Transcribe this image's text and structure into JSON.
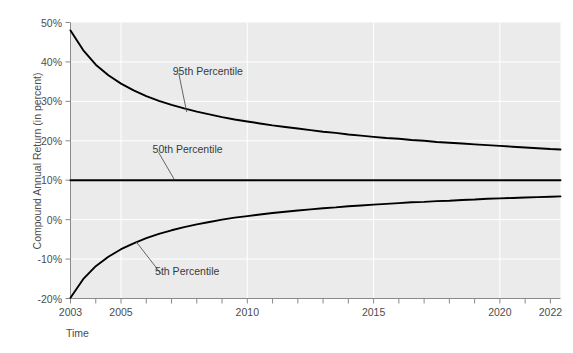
{
  "header_fragment": "",
  "chart_data": {
    "type": "line",
    "title": "",
    "xlabel": "Time",
    "ylabel": "Compound Annual Return (in percent)",
    "xlim": [
      2003,
      2022.4
    ],
    "ylim": [
      -20,
      50
    ],
    "grid": true,
    "legend_position": "inline-annotations",
    "x_ticks": [
      {
        "value": 2003,
        "label": "2003"
      },
      {
        "value": 2004,
        "label": ""
      },
      {
        "value": 2005,
        "label": "2005"
      },
      {
        "value": 2006,
        "label": ""
      },
      {
        "value": 2007,
        "label": ""
      },
      {
        "value": 2008,
        "label": ""
      },
      {
        "value": 2009,
        "label": ""
      },
      {
        "value": 2010,
        "label": "2010"
      },
      {
        "value": 2011,
        "label": ""
      },
      {
        "value": 2012,
        "label": ""
      },
      {
        "value": 2013,
        "label": ""
      },
      {
        "value": 2014,
        "label": ""
      },
      {
        "value": 2015,
        "label": "2015"
      },
      {
        "value": 2016,
        "label": ""
      },
      {
        "value": 2017,
        "label": ""
      },
      {
        "value": 2018,
        "label": ""
      },
      {
        "value": 2019,
        "label": ""
      },
      {
        "value": 2020,
        "label": "2020"
      },
      {
        "value": 2021,
        "label": ""
      },
      {
        "value": 2022,
        "label": "2022"
      }
    ],
    "y_ticks": [
      {
        "value": 50,
        "label": "50%"
      },
      {
        "value": 40,
        "label": "40%"
      },
      {
        "value": 30,
        "label": "30%"
      },
      {
        "value": 20,
        "label": "20%"
      },
      {
        "value": 10,
        "label": "10%"
      },
      {
        "value": 0,
        "label": "0%"
      },
      {
        "value": -10,
        "label": "-10%"
      },
      {
        "value": -20,
        "label": "-20%"
      }
    ],
    "gridlines_x": [
      2005,
      2010,
      2015,
      2020
    ],
    "gridlines_y": [
      50,
      40,
      30,
      20,
      10,
      0,
      -10,
      -20
    ],
    "x": [
      2003,
      2003.5,
      2004,
      2004.5,
      2005,
      2005.5,
      2006,
      2006.5,
      2007,
      2007.5,
      2008,
      2008.5,
      2009,
      2009.5,
      2010,
      2010.5,
      2011,
      2011.5,
      2012,
      2012.5,
      2013,
      2013.5,
      2014,
      2014.5,
      2015,
      2015.5,
      2016,
      2016.5,
      2017,
      2017.5,
      2018,
      2018.5,
      2019,
      2019.5,
      2020,
      2020.5,
      2021,
      2021.5,
      2022,
      2022.4
    ],
    "series": [
      {
        "name": "95th Percentile",
        "color": "#000000",
        "values": [
          48.0,
          43.0,
          39.3,
          36.6,
          34.5,
          32.8,
          31.3,
          30.1,
          29.1,
          28.2,
          27.4,
          26.7,
          26.0,
          25.4,
          24.9,
          24.4,
          23.9,
          23.5,
          23.1,
          22.7,
          22.3,
          22.0,
          21.6,
          21.3,
          21.0,
          20.7,
          20.5,
          20.2,
          20.0,
          19.7,
          19.5,
          19.3,
          19.1,
          18.9,
          18.7,
          18.5,
          18.3,
          18.1,
          17.9,
          17.8
        ]
      },
      {
        "name": "50th Percentile",
        "color": "#000000",
        "values": [
          10.0,
          10.0,
          10.0,
          10.0,
          10.0,
          10.0,
          10.0,
          10.0,
          10.0,
          10.0,
          10.0,
          10.0,
          10.0,
          10.0,
          10.0,
          10.0,
          10.0,
          10.0,
          10.0,
          10.0,
          10.0,
          10.0,
          10.0,
          10.0,
          10.0,
          10.0,
          10.0,
          10.0,
          10.0,
          10.0,
          10.0,
          10.0,
          10.0,
          10.0,
          10.0,
          10.0,
          10.0,
          10.0,
          10.0,
          10.0
        ]
      },
      {
        "name": "5th Percentile",
        "color": "#000000",
        "values": [
          -19.8,
          -15.1,
          -11.8,
          -9.4,
          -7.5,
          -6.0,
          -4.7,
          -3.6,
          -2.7,
          -1.9,
          -1.2,
          -0.6,
          0.0,
          0.5,
          0.9,
          1.3,
          1.7,
          2.0,
          2.3,
          2.6,
          2.9,
          3.1,
          3.4,
          3.6,
          3.8,
          4.0,
          4.2,
          4.4,
          4.5,
          4.7,
          4.8,
          5.0,
          5.1,
          5.3,
          5.4,
          5.5,
          5.6,
          5.7,
          5.8,
          5.9
        ]
      }
    ],
    "annotations": [
      {
        "text": "95th Percentile",
        "label_x": 2007.05,
        "label_y": 37.8,
        "anchor_x": 2007.6,
        "anchor_y": 27.3
      },
      {
        "text": "50th Percentile",
        "label_x": 2006.25,
        "label_y": 17.8,
        "anchor_x": 2007.1,
        "anchor_y": 10.3
      },
      {
        "text": "5th Percentile",
        "label_x": 2006.35,
        "label_y": -13.0,
        "anchor_x": 2005.6,
        "anchor_y": -5.6
      }
    ]
  }
}
